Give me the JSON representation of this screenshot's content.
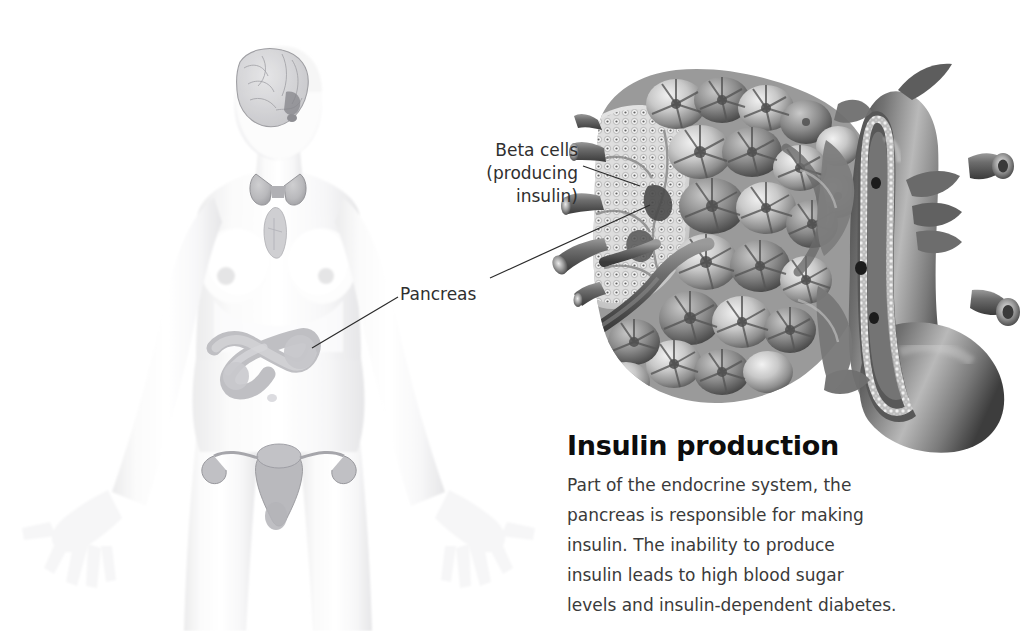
{
  "background_color": "#ffffff",
  "figure": {
    "alt": "pale grayscale female body showing endocrine organs",
    "organs": [
      "brain",
      "pituitary",
      "thyroid",
      "thymus",
      "pancreas",
      "uterus",
      "ovaries"
    ]
  },
  "callouts": {
    "beta_cells": {
      "lines": [
        "Beta cells",
        "(producing",
        "insulin)"
      ],
      "color": "#2f2f2f"
    },
    "pancreas": {
      "label": "Pancreas",
      "color": "#2f2f2f"
    }
  },
  "leader_lines": [
    {
      "name": "beta-cells-leader",
      "x1": 583,
      "y1": 166,
      "x2": 640,
      "y2": 185
    },
    {
      "name": "pancreas-to-organ-leader",
      "x1": 490,
      "y1": 278,
      "x2": 648,
      "y2": 205
    },
    {
      "name": "pancreas-to-body-leader",
      "x1": 398,
      "y1": 297,
      "x2": 312,
      "y2": 348
    }
  ],
  "caption": {
    "heading": "Insulin production",
    "heading_color": "#0d0d0d",
    "body_color": "#3a3a3a",
    "body_lines": [
      "Part of the endocrine system, the",
      "pancreas is responsible for making",
      "insulin. The inability to produce",
      "insulin leads to high blood sugar",
      "levels and insulin-dependent diabetes."
    ]
  },
  "illustration": {
    "name": "pancreas-cross-section",
    "description": "magnified pancreas showing acinar lobules, islet of Langerhans, blood vessels and main duct",
    "parts": [
      "acinar-lobules",
      "islet-of-langerhans",
      "blood-vessels",
      "pancreatic-duct",
      "ductules"
    ]
  }
}
